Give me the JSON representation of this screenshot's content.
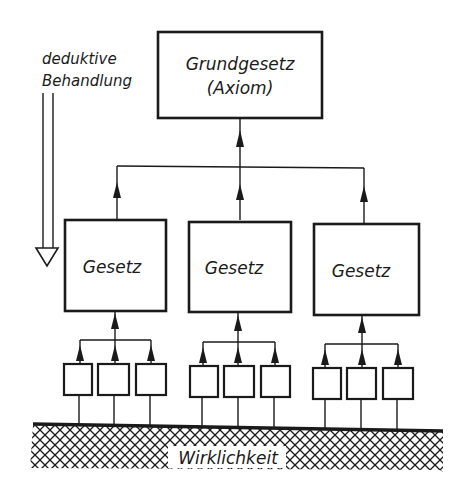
{
  "diagram": {
    "side_label": {
      "line1": "deduktive",
      "line2": "Behandlung"
    },
    "top_box": {
      "line1": "Grundgesetz",
      "line2": "(Axiom)"
    },
    "law_boxes": [
      {
        "label": "Gesetz"
      },
      {
        "label": "Gesetz"
      },
      {
        "label": "Gesetz"
      }
    ],
    "observation_boxes_per_law": 3,
    "ground_label": "Wirklichkeit",
    "colors": {
      "ink": "#1a1a1a",
      "background": "#ffffff"
    }
  }
}
